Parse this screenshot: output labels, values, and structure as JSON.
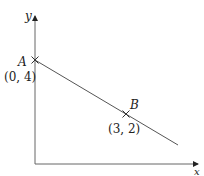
{
  "diagram": {
    "axes": {
      "x_label": "x",
      "y_label": "y"
    },
    "points": [
      {
        "name": "A",
        "coords": "(0, 4)"
      },
      {
        "name": "B",
        "coords": "(3, 2)"
      }
    ],
    "line_color": "#555555",
    "axis_color": "#666666"
  }
}
